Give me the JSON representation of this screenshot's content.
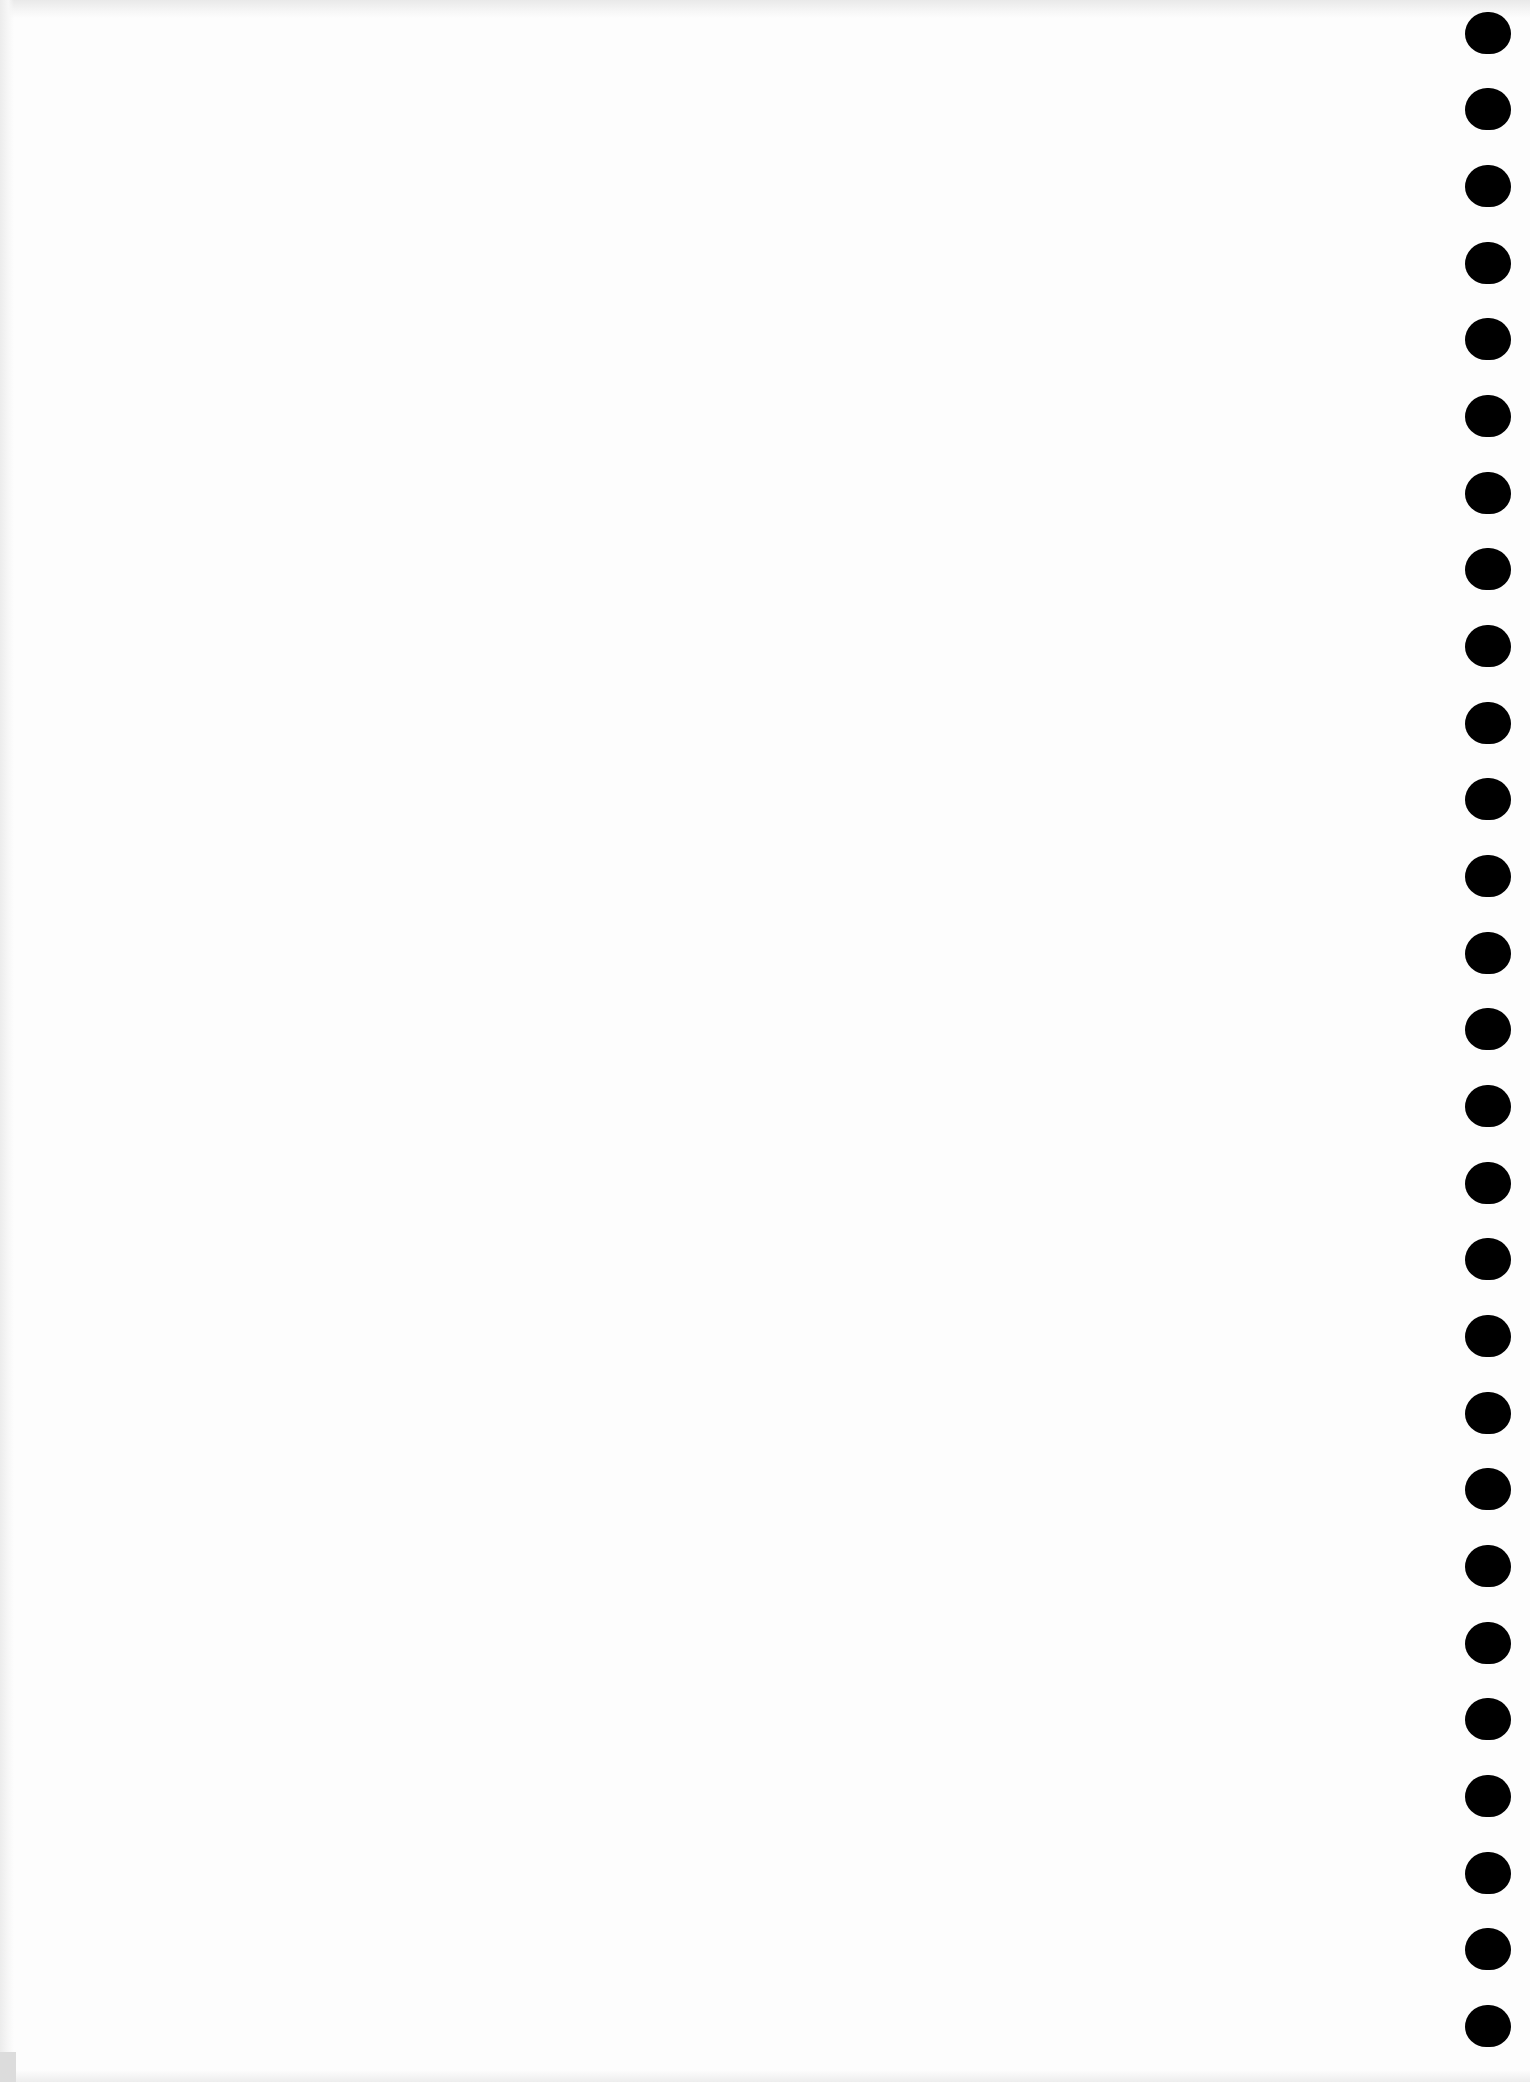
{
  "page": {
    "type": "blank scanned sheet",
    "background_color": "#fdfdfd",
    "text_content": ""
  },
  "binding": {
    "side": "right",
    "hole_color": "#000000",
    "hole_count": 27,
    "hole_width": 46,
    "hole_height": 42,
    "holes": [
      {
        "top": 12
      },
      {
        "top": 88
      },
      {
        "top": 165
      },
      {
        "top": 242
      },
      {
        "top": 318
      },
      {
        "top": 395
      },
      {
        "top": 472
      },
      {
        "top": 548
      },
      {
        "top": 625
      },
      {
        "top": 702
      },
      {
        "top": 778
      },
      {
        "top": 855
      },
      {
        "top": 932
      },
      {
        "top": 1008
      },
      {
        "top": 1085
      },
      {
        "top": 1162
      },
      {
        "top": 1238
      },
      {
        "top": 1315
      },
      {
        "top": 1392
      },
      {
        "top": 1468
      },
      {
        "top": 1545
      },
      {
        "top": 1622
      },
      {
        "top": 1698
      },
      {
        "top": 1775
      },
      {
        "top": 1852
      },
      {
        "top": 1928
      },
      {
        "top": 2005
      }
    ]
  }
}
